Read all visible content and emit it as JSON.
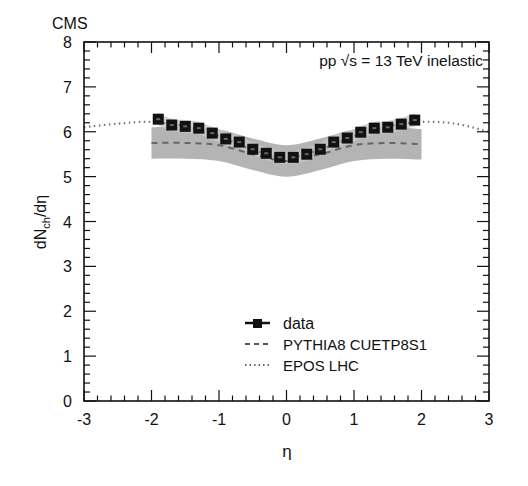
{
  "chart_data": {
    "type": "scatter",
    "title": "CMS",
    "annotation": "pp √s = 13 TeV inelastic",
    "xlabel": "η",
    "ylabel": "dN_ch/dη",
    "ylabel_main": "dN",
    "ylabel_sub": "ch",
    "ylabel_tail": "/dη",
    "xlim": [
      -3,
      3
    ],
    "ylim": [
      0,
      8
    ],
    "xticks": [
      -3,
      -2,
      -1,
      0,
      1,
      2,
      3
    ],
    "yticks": [
      0,
      1,
      2,
      3,
      4,
      5,
      6,
      7,
      8
    ],
    "grid": false,
    "legend_position": "lower center",
    "legend": [
      {
        "label": "data",
        "style": "marker-square-line"
      },
      {
        "label": "PYTHIA8 CUETP8S1",
        "style": "dashed"
      },
      {
        "label": "EPOS LHC",
        "style": "dotted"
      }
    ],
    "series": [
      {
        "name": "data",
        "x": [
          -1.9,
          -1.7,
          -1.5,
          -1.3,
          -1.1,
          -0.9,
          -0.7,
          -0.5,
          -0.3,
          -0.1,
          0.1,
          0.3,
          0.5,
          0.7,
          0.9,
          1.1,
          1.3,
          1.5,
          1.7,
          1.9
        ],
        "values": [
          6.28,
          6.15,
          6.12,
          6.08,
          5.97,
          5.84,
          5.77,
          5.61,
          5.52,
          5.43,
          5.43,
          5.5,
          5.61,
          5.77,
          5.86,
          5.99,
          6.08,
          6.1,
          6.17,
          6.26
        ],
        "syst_band_color": "#a8a8a8"
      },
      {
        "name": "PYTHIA8 CUETP8S1",
        "x": [
          -2.0,
          -1.5,
          -1.0,
          -0.5,
          0.0,
          0.5,
          1.0,
          1.5,
          2.0
        ],
        "values": [
          5.75,
          5.75,
          5.7,
          5.5,
          5.35,
          5.5,
          5.7,
          5.75,
          5.72
        ],
        "band_lower": [
          5.4,
          5.4,
          5.35,
          5.15,
          5.0,
          5.15,
          5.35,
          5.4,
          5.38
        ],
        "band_upper": [
          6.1,
          6.1,
          6.05,
          5.85,
          5.7,
          5.85,
          6.05,
          6.1,
          6.06
        ]
      },
      {
        "name": "EPOS LHC",
        "x": [
          -3.0,
          -2.5,
          -2.0,
          -1.5,
          -1.0,
          -0.5,
          0.0,
          0.5,
          1.0,
          1.5,
          2.0,
          2.5,
          3.0
        ],
        "values": [
          6.1,
          6.18,
          6.22,
          6.12,
          5.9,
          5.6,
          5.42,
          5.6,
          5.9,
          6.12,
          6.22,
          6.18,
          6.0
        ]
      }
    ]
  }
}
